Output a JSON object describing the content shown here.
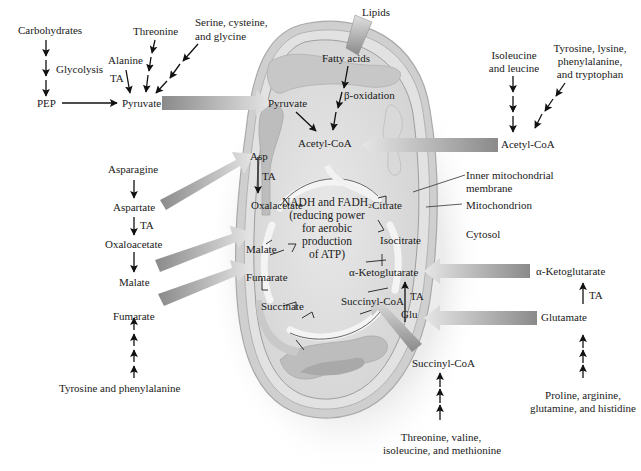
{
  "diagram": {
    "colors": {
      "background": "#ffffff",
      "mito_outer": "#d2d2d2",
      "mito_inner": "#e4e4e4",
      "matrix": "#dedede",
      "cristae": "#c4c4c4",
      "arrow_dark": "#8a8a8a",
      "arrow_light": "#e0e0e0",
      "text": "#1a1a1a"
    },
    "left_column": {
      "carbohydrates": "Carbohydrates",
      "glycolysis": "Glycolysis",
      "pep": "PEP",
      "alanine": "Alanine",
      "ta_alanine": "TA",
      "threonine": "Threonine",
      "serine_line1": "Serine, cysteine,",
      "serine_line2": "and glycine",
      "pyruvate": "Pyruvate",
      "asparagine": "Asparagine",
      "aspartate": "Aspartate",
      "ta_aspartate": "TA",
      "oxaloacetate": "Oxaloacetate",
      "malate": "Malate",
      "fumarate": "Fumarate",
      "tyrosine_phe": "Tyrosine and phenylalanine"
    },
    "top": {
      "lipids": "Lipids"
    },
    "mitochondrion": {
      "fatty_acids": "Fatty acids",
      "beta_oxidation": "β-oxidation",
      "pyruvate": "Pyruvate",
      "acetyl_coa": "Acetyl-CoA",
      "asp": "Asp",
      "ta_asp": "TA",
      "citrate": "Citrate",
      "isocitrate": "Isocitrate",
      "alpha_kg": "α-Ketoglutarate",
      "succinyl_coa": "Succinyl-CoA",
      "glu": "Glu",
      "ta_glu": "TA",
      "succinate": "Succinate",
      "fumarate": "Fumarate",
      "malate": "Malate",
      "oxalacetate": "Oxalacetate",
      "center_line1": "NADH and FADH₂",
      "center_line2": "(reducing power",
      "center_line3": "for aerobic",
      "center_line4": "production",
      "center_line5": "of ATP)"
    },
    "right_column": {
      "isoleucine_line1": "Isoleucine",
      "isoleucine_line2": "and leucine",
      "tyrosine_line1": "Tyrosine, lysine,",
      "tyrosine_line2": "phenylalanine,",
      "tyrosine_line3": "and tryptophan",
      "acetyl_coa": "Acetyl-CoA",
      "inner_membrane_line1": "Inner mitochondrial",
      "inner_membrane_line2": "membrane",
      "mitochondrion": "Mitochondrion",
      "cytosol": "Cytosol",
      "alpha_kg": "α-Ketoglutarate",
      "ta_glutamate": "TA",
      "glutamate": "Glutamate",
      "proline_line1": "Proline, arginine,",
      "proline_line2": "glutamine, and histidine"
    },
    "bottom": {
      "succinyl_coa": "Succinyl-CoA",
      "threonine_line1": "Threonine, valine,",
      "threonine_line2": "isoleucine, and methionine"
    }
  }
}
